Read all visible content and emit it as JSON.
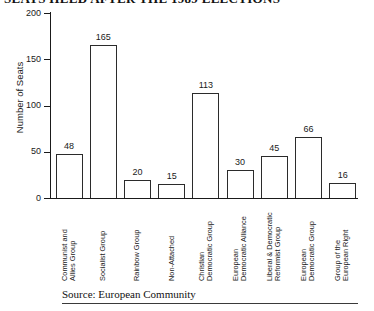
{
  "title": "SEATS HELD AFTER THE 1989 ELECTIONS",
  "source": "Source: European Community",
  "chart_data": {
    "type": "bar",
    "title": "SEATS HELD AFTER THE 1989 ELECTIONS",
    "xlabel": "",
    "ylabel": "Number of Seats",
    "ylim": [
      0,
      200
    ],
    "yticks": [
      0,
      50,
      100,
      150,
      200
    ],
    "ytick_labels": [
      "0",
      "50",
      "100",
      "150",
      "200"
    ],
    "grid": false,
    "legend": false,
    "categories": [
      "Communist and\nAllies Group",
      "Socialist Group",
      "Rainbow Group",
      "Non-Attached",
      "Christian\nDemocratic Group",
      "European\nDemocratic Alliance",
      "Liberal & Democratic\nReformist Group",
      "European\nDemocratic Group",
      "Group of the\nEuropean Right"
    ],
    "values": [
      48,
      165,
      20,
      15,
      113,
      30,
      45,
      66,
      16
    ],
    "value_labels": [
      "48",
      "165",
      "20",
      "15",
      "113",
      "30",
      "45",
      "66",
      "16"
    ],
    "annotation": "Source: European Community"
  }
}
